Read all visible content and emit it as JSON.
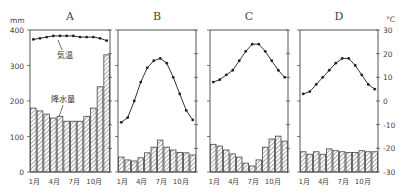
{
  "chart_data": {
    "type": "climograph",
    "panels": [
      {
        "title": "A",
        "months": [
          "1月",
          "2月",
          "3月",
          "4月",
          "5月",
          "6月",
          "7月",
          "8月",
          "9月",
          "10月",
          "11月",
          "12月"
        ],
        "temperature_c": [
          26,
          26.5,
          27,
          27.5,
          27.5,
          27.5,
          27.5,
          27,
          27,
          27,
          26.5,
          25.5
        ],
        "precipitation_mm": [
          180,
          172,
          163,
          152,
          157,
          143,
          143,
          143,
          157,
          180,
          240,
          330
        ],
        "annotations": {
          "temperature_label": "気温",
          "precipitation_label": "降水量"
        }
      },
      {
        "title": "B",
        "months": [
          "1月",
          "2月",
          "3月",
          "4月",
          "5月",
          "6月",
          "7月",
          "8月",
          "9月",
          "10月",
          "11月",
          "12月"
        ],
        "temperature_c": [
          -9,
          -7,
          0,
          8,
          14,
          17,
          18,
          16,
          10,
          3,
          -4,
          -8
        ],
        "precipitation_mm": [
          42,
          34,
          31,
          40,
          54,
          70,
          90,
          70,
          62,
          55,
          54,
          48
        ]
      },
      {
        "title": "C",
        "months": [
          "1月",
          "2月",
          "3月",
          "4月",
          "5月",
          "6月",
          "7月",
          "8月",
          "9月",
          "10月",
          "11月",
          "12月"
        ],
        "temperature_c": [
          8,
          9,
          11,
          13,
          17,
          21,
          24,
          24,
          21,
          17,
          13,
          10
        ],
        "precipitation_mm": [
          78,
          73,
          62,
          51,
          42,
          25,
          17,
          34,
          70,
          93,
          101,
          87
        ]
      },
      {
        "title": "D",
        "months": [
          "1月",
          "2月",
          "3月",
          "4月",
          "5月",
          "6月",
          "7月",
          "8月",
          "9月",
          "10月",
          "11月",
          "12月"
        ],
        "temperature_c": [
          3,
          4,
          7,
          10,
          13,
          16,
          18,
          18,
          15,
          11,
          7,
          5
        ],
        "precipitation_mm": [
          57,
          50,
          57,
          50,
          65,
          60,
          57,
          55,
          55,
          60,
          57,
          57
        ]
      }
    ],
    "left_axis": {
      "label": "mm",
      "ticks": [
        0,
        100,
        200,
        300,
        400
      ],
      "ylim": [
        0,
        400
      ]
    },
    "right_axis": {
      "label": "°C",
      "ticks": [
        30,
        20,
        10,
        0,
        -10,
        -20,
        -30
      ],
      "ylim": [
        -30,
        30
      ]
    },
    "x_tick_labels": [
      "1月",
      "4月",
      "7月",
      "10月"
    ],
    "grid": false,
    "legend": "none"
  },
  "labels": {
    "left_unit": "mm",
    "right_unit": "°C",
    "temp_annotation": "気温",
    "precip_annotation": "降水量"
  }
}
